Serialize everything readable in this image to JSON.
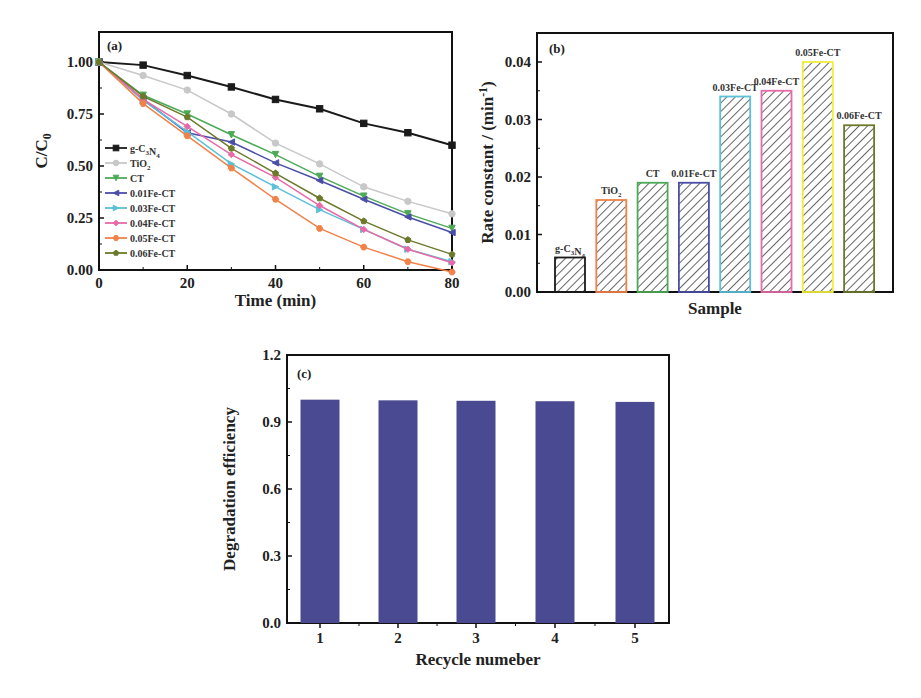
{
  "chart_data": [
    {
      "panel": "(a)",
      "type": "line",
      "xlabel": "Time (min)",
      "ylabel": "C/C0",
      "xlim": [
        0,
        80
      ],
      "ylim": [
        0,
        1.12
      ],
      "xticks": [
        0,
        20,
        40,
        60,
        80
      ],
      "yticks": [
        "0.00",
        "0.25",
        "0.50",
        "0.75",
        "1.00"
      ],
      "legend_position": "middle-left",
      "x": [
        0,
        10,
        20,
        30,
        40,
        50,
        60,
        70,
        80
      ],
      "series": [
        {
          "name": "g-C3N4",
          "color": "#1a1a1a",
          "marker": "square",
          "values": [
            1.0,
            0.985,
            0.935,
            0.88,
            0.82,
            0.775,
            0.705,
            0.66,
            0.6
          ]
        },
        {
          "name": "TiO2",
          "color": "#c8c8c8",
          "marker": "circle",
          "values": [
            1.0,
            0.935,
            0.865,
            0.75,
            0.61,
            0.51,
            0.4,
            0.33,
            0.27
          ]
        },
        {
          "name": "CT",
          "color": "#4daa57",
          "marker": "triangle-down",
          "values": [
            1.0,
            0.84,
            0.75,
            0.65,
            0.555,
            0.45,
            0.355,
            0.27,
            0.2
          ]
        },
        {
          "name": "0.01Fe-CT",
          "color": "#4b4ea8",
          "marker": "triangle-left",
          "values": [
            1.0,
            0.82,
            0.66,
            0.615,
            0.515,
            0.43,
            0.34,
            0.255,
            0.18
          ]
        },
        {
          "name": "0.03Fe-CT",
          "color": "#5bc0d8",
          "marker": "triangle-right",
          "values": [
            1.0,
            0.815,
            0.665,
            0.51,
            0.4,
            0.29,
            0.195,
            0.1,
            0.04
          ]
        },
        {
          "name": "0.04Fe-CT",
          "color": "#e86aa8",
          "marker": "diamond",
          "values": [
            1.0,
            0.82,
            0.69,
            0.555,
            0.445,
            0.31,
            0.195,
            0.1,
            0.035
          ]
        },
        {
          "name": "0.05Fe-CT",
          "color": "#f0824a",
          "marker": "hexagon",
          "values": [
            1.0,
            0.8,
            0.645,
            0.49,
            0.34,
            0.2,
            0.11,
            0.04,
            -0.01
          ]
        },
        {
          "name": "0.06Fe-CT",
          "color": "#6b7a2a",
          "marker": "pentagon",
          "values": [
            1.0,
            0.835,
            0.735,
            0.585,
            0.465,
            0.345,
            0.235,
            0.145,
            0.075
          ]
        }
      ]
    },
    {
      "panel": "(b)",
      "type": "bar",
      "xlabel": "Sample",
      "ylabel": "Rate constant / (min⁻¹)",
      "ylim": [
        0,
        0.045
      ],
      "yticks": [
        "0.00",
        "0.01",
        "0.02",
        "0.03",
        "0.04"
      ],
      "categories": [
        "g-C3N4",
        "TiO2",
        "CT",
        "0.01Fe-CT",
        "0.03Fe-CT",
        "0.04Fe-CT",
        "0.05Fe-CT",
        "0.06Fe-CT"
      ],
      "category_labels": [
        "g-C₃N₄",
        "TiO₂",
        "CT",
        "0.01Fe-CT",
        "0.03Fe-CT",
        "0.04Fe-CT",
        "0.05Fe-CT",
        "0.06Fe-CT"
      ],
      "values": [
        0.006,
        0.016,
        0.019,
        0.019,
        0.034,
        0.035,
        0.04,
        0.029
      ],
      "colors": [
        "#1a1a1a",
        "#f0824a",
        "#4daa57",
        "#4b4ea8",
        "#5bc0d8",
        "#e86aa8",
        "#f2ee3a",
        "#6b7a2a"
      ],
      "fill": "hatched"
    },
    {
      "panel": "(c)",
      "type": "bar",
      "xlabel": "Recycle numeber",
      "ylabel": "Degradation efficiency",
      "ylim": [
        0,
        1.2
      ],
      "yticks": [
        "0.0",
        "0.3",
        "0.6",
        "0.9",
        "1.2"
      ],
      "categories": [
        "1",
        "2",
        "3",
        "4",
        "5"
      ],
      "values": [
        1.0,
        0.997,
        0.995,
        0.993,
        0.99
      ],
      "color": "#4a4a92"
    }
  ]
}
